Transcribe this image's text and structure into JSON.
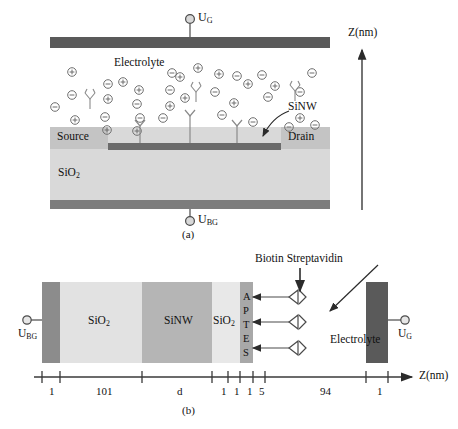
{
  "figure": {
    "panel_a": {
      "caption": "(a)",
      "top_gate_terminal_label": "U_G",
      "bottom_gate_terminal_label": "U_BG",
      "electrolyte_label": "Electrolyte",
      "source_label": "Source",
      "drain_label": "Drain",
      "oxide_label": "SiO2",
      "nanowire_label": "SiNW",
      "axis_label": "Z(nm)",
      "ion_plus_symbol": "⊕",
      "ion_minus_symbol": "⊖",
      "ions": [
        {
          "t": "+",
          "x": 72,
          "y": 72
        },
        {
          "t": "-",
          "x": 72,
          "y": 95
        },
        {
          "t": "-",
          "x": 55,
          "y": 107
        },
        {
          "t": "+",
          "x": 75,
          "y": 120
        },
        {
          "t": "-",
          "x": 108,
          "y": 84
        },
        {
          "t": "+",
          "x": 108,
          "y": 99
        },
        {
          "t": "+",
          "x": 107,
          "y": 130
        },
        {
          "t": "-",
          "x": 105,
          "y": 117
        },
        {
          "t": "+",
          "x": 123,
          "y": 82
        },
        {
          "t": "-",
          "x": 137,
          "y": 104
        },
        {
          "t": "+",
          "x": 139,
          "y": 90
        },
        {
          "t": "+",
          "x": 137,
          "y": 131
        },
        {
          "t": "-",
          "x": 140,
          "y": 118
        },
        {
          "t": "-",
          "x": 172,
          "y": 73
        },
        {
          "t": "+",
          "x": 180,
          "y": 77
        },
        {
          "t": "+",
          "x": 198,
          "y": 68
        },
        {
          "t": "-",
          "x": 170,
          "y": 90
        },
        {
          "t": "+",
          "x": 185,
          "y": 98
        },
        {
          "t": "-",
          "x": 163,
          "y": 118
        },
        {
          "t": "+",
          "x": 170,
          "y": 106
        },
        {
          "t": "-",
          "x": 215,
          "y": 92
        },
        {
          "t": "+",
          "x": 219,
          "y": 74
        },
        {
          "t": "-",
          "x": 222,
          "y": 115
        },
        {
          "t": "+",
          "x": 234,
          "y": 103
        },
        {
          "t": "-",
          "x": 237,
          "y": 76
        },
        {
          "t": "+",
          "x": 248,
          "y": 84
        },
        {
          "t": "-",
          "x": 253,
          "y": 122
        },
        {
          "t": "-",
          "x": 262,
          "y": 75
        },
        {
          "t": "-",
          "x": 268,
          "y": 97
        },
        {
          "t": "+",
          "x": 275,
          "y": 86
        },
        {
          "t": "-",
          "x": 289,
          "y": 127
        },
        {
          "t": "-",
          "x": 312,
          "y": 73
        },
        {
          "t": "-",
          "x": 315,
          "y": 125
        },
        {
          "t": "-",
          "x": 300,
          "y": 92
        },
        {
          "t": "+",
          "x": 300,
          "y": 118
        }
      ],
      "antibodies_free": [
        {
          "x": 90,
          "y": 93
        },
        {
          "x": 196,
          "y": 86
        },
        {
          "x": 295,
          "y": 85
        }
      ],
      "antibodies_bound": [
        {
          "x": 140,
          "y": 120
        },
        {
          "x": 190,
          "y": 110
        },
        {
          "x": 237,
          "y": 120
        }
      ]
    },
    "panel_b": {
      "caption": "(b)",
      "left_terminal_label": "U_BG",
      "right_terminal_label": "U_G",
      "axis_label": "Z(nm)",
      "electrolyte_label": "Electrolyte",
      "annotation_label": "Biotin Streptavidin",
      "layers": [
        {
          "name": "metal-back-gate",
          "label": "",
          "x": 42,
          "w": 18,
          "fill": "#8c8c8c"
        },
        {
          "name": "sio2-thick",
          "label": "SiO2",
          "x": 60,
          "w": 82,
          "fill": "#e2e2e2"
        },
        {
          "name": "sinw",
          "label": "SiNW",
          "x": 142,
          "w": 70,
          "fill": "#b5b5b5"
        },
        {
          "name": "sio2-thin",
          "label": "SiO2",
          "x": 212,
          "w": 28,
          "fill": "#e8e8e8"
        },
        {
          "name": "aptes",
          "label": "APTES",
          "x": 240,
          "w": 13,
          "fill": "#a8a8a8"
        }
      ],
      "ticks": [
        {
          "x": 42,
          "label": "1",
          "label_x": 49
        },
        {
          "x": 60,
          "label": "101",
          "label_x": 96
        },
        {
          "x": 142,
          "label": "d",
          "label_x": 177
        },
        {
          "x": 212,
          "label": "1",
          "label_x": 221
        },
        {
          "x": 228,
          "label": "1",
          "label_x": 234
        },
        {
          "x": 240,
          "label": "1",
          "label_x": 247
        },
        {
          "x": 253,
          "label": "5",
          "label_x": 259
        },
        {
          "x": 265,
          "label": "94",
          "label_x": 320
        },
        {
          "x": 366,
          "label": "1",
          "label_x": 377
        },
        {
          "x": 388,
          "label": "",
          "label_x": 0
        }
      ],
      "aptes_letters": [
        "A",
        "P",
        "T",
        "E",
        "S"
      ],
      "binder_rows_y": [
        297,
        322,
        348
      ]
    },
    "colors": {
      "electrode_dark": "#5a5a5a",
      "metal_gray": "#8c8c8c",
      "oxide_light": "#e2e2e2",
      "substrate": "#d9d9d9",
      "source_drain": "#c8c8c8",
      "nanowire": "#6b6b6b",
      "line": "#3a3a3a"
    }
  }
}
